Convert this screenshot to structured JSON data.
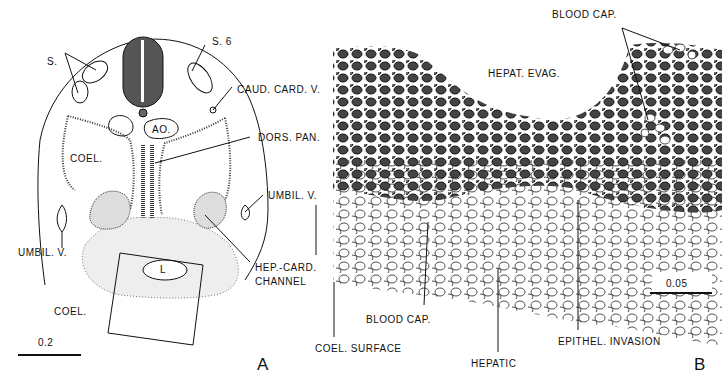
{
  "figure": {
    "panel_a": {
      "letter": "A",
      "labels": {
        "s": "S.",
        "s6": "S. 6",
        "caud_card_v": "CAUD. CARD. V.",
        "ao": "AO.",
        "dors_pan": "DORS. PAN.",
        "coel_top": "COEL.",
        "umbil_v_right": "UMBIL. V.",
        "umbil_v_left": "UMBIL. V.",
        "l": "L",
        "hep_card_1": "HEP.-CARD.",
        "hep_card_2": "CHANNEL",
        "coel_bottom": "COEL."
      },
      "scale_bar": "0.2"
    },
    "panel_b": {
      "letter": "B",
      "labels": {
        "blood_cap_top": "BLOOD CAP.",
        "hepat_evag": "HEPAT. EVAG.",
        "blood_cap_bottom": "BLOOD CAP.",
        "coel_surface": "COEL. SURFACE",
        "hepatic": "HEPATIC",
        "epithel_invasion": "EPITHEL. INVASION"
      },
      "scale_bar": "0.05"
    }
  }
}
